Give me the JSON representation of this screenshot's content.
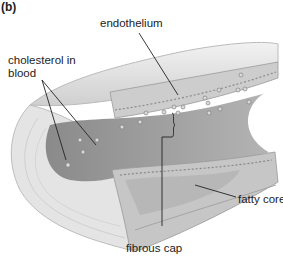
{
  "figure": {
    "panel": "(b)"
  },
  "labels": {
    "endothelium": "endothelium",
    "cholesterol_line1": "cholesterol in",
    "cholesterol_line2": "blood",
    "fatty_core": "fatty core",
    "fibrous_cap": "fibrous cap"
  },
  "colors": {
    "outer_wall": "#e6e6e6",
    "wall_section": "#d2d2d2",
    "lumen": "#a9a9a9",
    "plaque": "#bdbdbd",
    "line": "#222222"
  }
}
